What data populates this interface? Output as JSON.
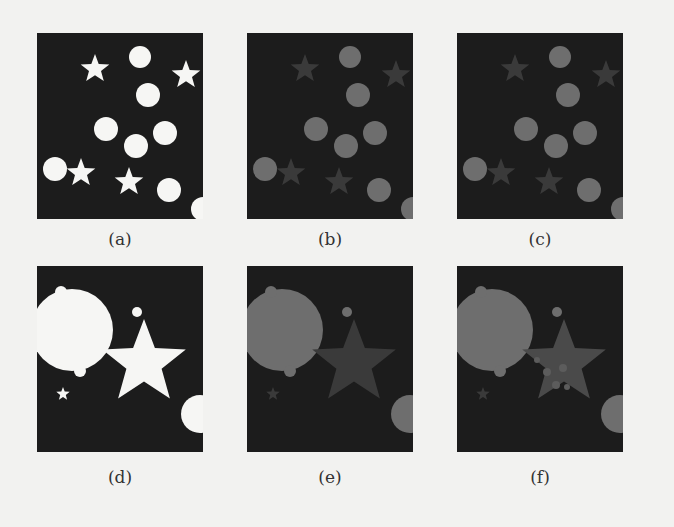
{
  "figure": {
    "colors": {
      "background": "#f2f2f0",
      "panel_bg": "#1c1c1c",
      "white": "#f6f6f4",
      "gray_circle": "#6e6e6e",
      "gray_star_dim": "#3a3a3a",
      "gray_star_mid": "#4a4a4a"
    },
    "panels": [
      {
        "id": "a",
        "label": "(a)",
        "left": 37,
        "top": 33,
        "caption_top": 229
      },
      {
        "id": "b",
        "label": "(b)",
        "left": 247,
        "top": 33,
        "caption_top": 229
      },
      {
        "id": "c",
        "label": "(c)",
        "left": 457,
        "top": 33,
        "caption_top": 229
      },
      {
        "id": "d",
        "label": "(d)",
        "left": 37,
        "top": 266,
        "caption_top": 467
      },
      {
        "id": "e",
        "label": "(e)",
        "left": 247,
        "top": 266,
        "caption_top": 467
      },
      {
        "id": "f",
        "label": "(f)",
        "left": 457,
        "top": 266,
        "caption_top": 467
      }
    ]
  },
  "scenes": {
    "top": {
      "circles": [
        {
          "cx": 103,
          "cy": 24,
          "r": 11
        },
        {
          "cx": 111,
          "cy": 62,
          "r": 12
        },
        {
          "cx": 69,
          "cy": 96,
          "r": 12
        },
        {
          "cx": 128,
          "cy": 100,
          "r": 12
        },
        {
          "cx": 99,
          "cy": 113,
          "r": 12
        },
        {
          "cx": 18,
          "cy": 136,
          "r": 12
        },
        {
          "cx": 132,
          "cy": 157,
          "r": 12
        },
        {
          "cx": 166,
          "cy": 176,
          "r": 12
        }
      ],
      "stars": [
        {
          "cx": 58,
          "cy": 36,
          "r": 15
        },
        {
          "cx": 149,
          "cy": 42,
          "r": 15
        },
        {
          "cx": 44,
          "cy": 140,
          "r": 15
        },
        {
          "cx": 92,
          "cy": 149,
          "r": 15
        }
      ]
    },
    "bottom": {
      "big_blob": {
        "cx": 35,
        "cy": 64,
        "r": 41
      },
      "blob_bumps": [
        {
          "cx": 24,
          "cy": 26,
          "r": 6
        },
        {
          "cx": 43,
          "cy": 105,
          "r": 6
        }
      ],
      "circles": [
        {
          "cx": 100,
          "cy": 46,
          "r": 5
        },
        {
          "cx": 163,
          "cy": 148,
          "r": 19
        }
      ],
      "big_star": {
        "cx": 107,
        "cy": 97,
        "r": 44
      },
      "small_star": {
        "cx": 26,
        "cy": 128,
        "r": 7
      },
      "f_spots": [
        {
          "cx": 90,
          "cy": 106,
          "r": 4
        },
        {
          "cx": 106,
          "cy": 102,
          "r": 4
        },
        {
          "cx": 99,
          "cy": 119,
          "r": 4
        },
        {
          "cx": 110,
          "cy": 121,
          "r": 3
        },
        {
          "cx": 80,
          "cy": 94,
          "r": 3
        }
      ]
    }
  }
}
